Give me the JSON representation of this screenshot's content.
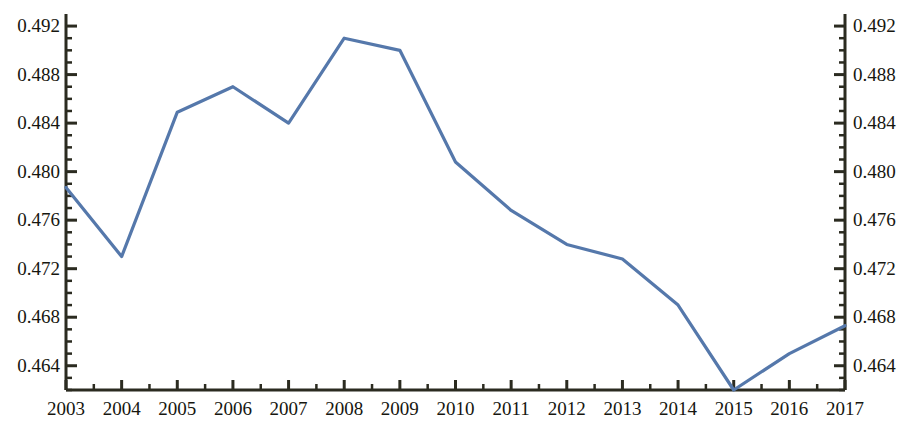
{
  "chart_data": {
    "type": "line",
    "title": "",
    "subtitle": "",
    "xlabel": "",
    "ylabel": "",
    "categories": [
      "2003",
      "2004",
      "2005",
      "2006",
      "2007",
      "2008",
      "2009",
      "2010",
      "2011",
      "2012",
      "2013",
      "2014",
      "2015",
      "2016",
      "2017"
    ],
    "x": [
      2003,
      2004,
      2005,
      2006,
      2007,
      2008,
      2009,
      2010,
      2011,
      2012,
      2013,
      2014,
      2015,
      2016,
      2017
    ],
    "values": [
      0.4787,
      0.473,
      0.4849,
      0.487,
      0.484,
      0.491,
      0.49,
      0.4808,
      0.4768,
      0.474,
      0.4728,
      0.469,
      0.462,
      0.465,
      0.4673
    ],
    "series": [
      {
        "name": "series-1",
        "color": "#5578ab",
        "values": [
          0.4787,
          0.473,
          0.4849,
          0.487,
          0.484,
          0.491,
          0.49,
          0.4808,
          0.4768,
          0.474,
          0.4728,
          0.469,
          0.462,
          0.465,
          0.4673
        ]
      }
    ],
    "ylim": [
      0.462,
      0.49283
    ],
    "xlim": [
      2003,
      2017
    ],
    "y_major_ticks": [
      0.464,
      0.468,
      0.472,
      0.476,
      0.48,
      0.484,
      0.488,
      0.492
    ],
    "y_tick_labels": [
      "0.464",
      "0.468",
      "0.472",
      "0.476",
      "0.480",
      "0.484",
      "0.488",
      "0.492"
    ],
    "y_minor_tick_count_per_major": 4,
    "x_major_ticks": [
      2003,
      2004,
      2005,
      2006,
      2007,
      2008,
      2009,
      2010,
      2011,
      2012,
      2013,
      2014,
      2015,
      2016,
      2017
    ],
    "x_minor_ticks_between": 1,
    "grid": false,
    "legend": null,
    "legend_position": "none",
    "dual_y_axis": true,
    "axis_color": "#2b2b20",
    "background_color": "#ffffff",
    "line_width": 3.2
  },
  "axes": {
    "left": {
      "name": "left-value-axis",
      "labels": [
        "0.492",
        "0.488",
        "0.484",
        "0.480",
        "0.476",
        "0.472",
        "0.468",
        "0.464"
      ]
    },
    "right": {
      "name": "right-value-axis",
      "labels": [
        "0.492",
        "0.488",
        "0.484",
        "0.480",
        "0.476",
        "0.472",
        "0.468",
        "0.464"
      ]
    },
    "bottom": {
      "name": "year-axis",
      "labels": [
        "2003",
        "2004",
        "2005",
        "2006",
        "2007",
        "2008",
        "2009",
        "2010",
        "2011",
        "2012",
        "2013",
        "2014",
        "2015",
        "2016",
        "2017"
      ]
    }
  }
}
